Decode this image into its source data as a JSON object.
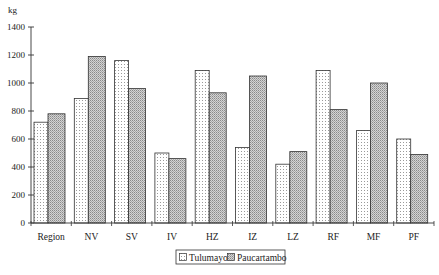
{
  "chart_data": {
    "type": "bar",
    "title": "",
    "xlabel": "",
    "ylabel": "kg",
    "ylim": [
      0,
      1400
    ],
    "yticks": [
      0,
      200,
      400,
      600,
      800,
      1000,
      1200,
      1400
    ],
    "grid": false,
    "legend_position": "bottom",
    "categories": [
      "Region",
      "NV",
      "SV",
      "IV",
      "HZ",
      "IZ",
      "LZ",
      "RF",
      "MF",
      "PF"
    ],
    "series": [
      {
        "name": "Tulumayo",
        "pattern": "sparse-dots",
        "color": "#ffffff",
        "values": [
          720,
          890,
          1160,
          500,
          1090,
          540,
          420,
          1090,
          660,
          600
        ]
      },
      {
        "name": "Paucartambo",
        "pattern": "dense-gray-stipple",
        "color": "#b8b8b8",
        "values": [
          780,
          1190,
          960,
          460,
          930,
          1050,
          510,
          810,
          1000,
          490
        ]
      }
    ]
  },
  "axis": {
    "y_unit": "kg",
    "y_tick_labels": [
      "0",
      "200",
      "400",
      "600",
      "800",
      "1000",
      "1200",
      "1400"
    ]
  },
  "legend": {
    "items": [
      {
        "label": "Tulumayo"
      },
      {
        "label": "Paucartambo"
      }
    ]
  }
}
